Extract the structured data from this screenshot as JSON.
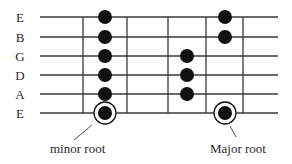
{
  "diagram": {
    "type": "guitar-fretboard-scale",
    "colors": {
      "line": "#3a3a3a",
      "dot": "#111111",
      "text": "#2a2a2a",
      "background": "#ffffff"
    },
    "strings": [
      {
        "label": "E",
        "y": 17
      },
      {
        "label": "B",
        "y": 37
      },
      {
        "label": "G",
        "y": 56
      },
      {
        "label": "D",
        "y": 75
      },
      {
        "label": "A",
        "y": 94
      },
      {
        "label": "E",
        "y": 113
      }
    ],
    "string_x_start": 40,
    "string_x_end": 278,
    "label_x": 20,
    "frets_x": [
      83,
      127,
      168,
      206,
      243
    ],
    "fret_y_top": 17,
    "fret_y_bottom": 113,
    "dot_radius": 7,
    "dots": [
      {
        "string": 0,
        "x": 105
      },
      {
        "string": 1,
        "x": 105
      },
      {
        "string": 2,
        "x": 105
      },
      {
        "string": 3,
        "x": 105
      },
      {
        "string": 4,
        "x": 105
      },
      {
        "string": 5,
        "x": 105,
        "root": true
      },
      {
        "string": 2,
        "x": 187
      },
      {
        "string": 3,
        "x": 187
      },
      {
        "string": 4,
        "x": 187
      },
      {
        "string": 0,
        "x": 225
      },
      {
        "string": 1,
        "x": 225
      },
      {
        "string": 5,
        "x": 225,
        "root": true
      }
    ],
    "root_ring_radius": 11,
    "annotations": [
      {
        "label": "minor root",
        "text_x": 50,
        "text_y": 153,
        "line": [
          92,
          125,
          74,
          140
        ]
      },
      {
        "label": "Major root",
        "text_x": 210,
        "text_y": 153,
        "line": [
          230,
          126,
          236,
          137
        ]
      }
    ]
  }
}
